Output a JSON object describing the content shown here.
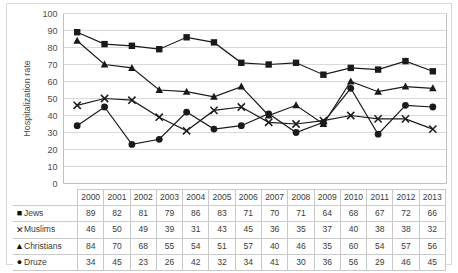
{
  "chart_data": {
    "type": "line",
    "title": "",
    "xlabel": "",
    "ylabel": "Hospitalization rate",
    "ylim": [
      0,
      100
    ],
    "ytick_step": 10,
    "yticks": [
      0,
      10,
      20,
      30,
      40,
      50,
      60,
      70,
      80,
      90,
      100
    ],
    "grid": "horizontal",
    "legend_position": "table-row-labels",
    "categories": [
      "2000",
      "2001",
      "2002",
      "2003",
      "2004",
      "2005",
      "2006",
      "2007",
      "2008",
      "2009",
      "2010",
      "2011",
      "2012",
      "2013"
    ],
    "series": [
      {
        "name": "Jews",
        "marker": "square",
        "color": "#1a1a1a",
        "values": [
          89,
          82,
          81,
          79,
          86,
          83,
          71,
          70,
          71,
          64,
          68,
          67,
          72,
          66
        ]
      },
      {
        "name": "Muslims",
        "marker": "x",
        "color": "#1a1a1a",
        "values": [
          46,
          50,
          49,
          39,
          31,
          43,
          45,
          36,
          35,
          37,
          40,
          38,
          38,
          32
        ]
      },
      {
        "name": "Christians",
        "marker": "triangle",
        "color": "#1a1a1a",
        "values": [
          84,
          70,
          68,
          55,
          54,
          51,
          57,
          40,
          46,
          35,
          60,
          54,
          57,
          56
        ]
      },
      {
        "name": "Druze",
        "marker": "circle",
        "color": "#1a1a1a",
        "values": [
          34,
          45,
          23,
          26,
          42,
          32,
          34,
          41,
          30,
          36,
          56,
          29,
          46,
          45
        ]
      }
    ]
  },
  "table": {
    "corner_label": "",
    "column_headers": [
      "2000",
      "2001",
      "2002",
      "2003",
      "2004",
      "2005",
      "2006",
      "2007",
      "2008",
      "2009",
      "2010",
      "2011",
      "2012",
      "2013"
    ],
    "rows": [
      {
        "label": "Jews",
        "marker_glyph": "■",
        "values": [
          "89",
          "82",
          "81",
          "79",
          "86",
          "83",
          "71",
          "70",
          "71",
          "64",
          "68",
          "67",
          "72",
          "66"
        ]
      },
      {
        "label": "Muslims",
        "marker_glyph": "✕",
        "values": [
          "46",
          "50",
          "49",
          "39",
          "31",
          "43",
          "45",
          "36",
          "35",
          "37",
          "40",
          "38",
          "38",
          "32"
        ]
      },
      {
        "label": "Christians",
        "marker_glyph": "▲",
        "values": [
          "84",
          "70",
          "68",
          "55",
          "54",
          "51",
          "57",
          "40",
          "46",
          "35",
          "60",
          "54",
          "57",
          "56"
        ]
      },
      {
        "label": "Druze",
        "marker_glyph": "●",
        "values": [
          "34",
          "45",
          "23",
          "26",
          "42",
          "32",
          "34",
          "41",
          "30",
          "36",
          "56",
          "29",
          "46",
          "45"
        ]
      }
    ]
  },
  "style": {
    "grid_color": "#d9d9d9",
    "axis_color": "#bfbfbf",
    "line_color": "#1a1a1a",
    "text_color": "#4d4d4d",
    "table_border_color": "#c9c9c9"
  }
}
